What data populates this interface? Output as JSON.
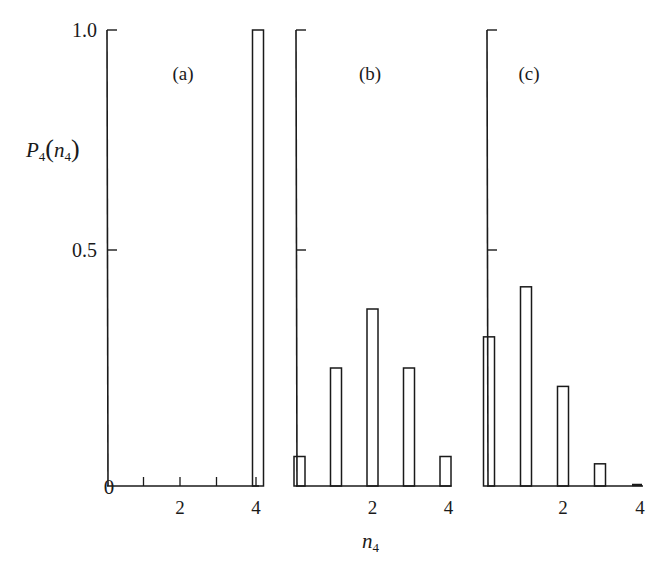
{
  "chart_data": {
    "type": "bar",
    "ylabel": "P4(n4)",
    "ylabel_main": "P",
    "ylabel_sub": "4",
    "ylabel_arg": "n",
    "ylabel_arg_sub": "4",
    "xlabel": "n4",
    "xlabel_main": "n",
    "xlabel_sub": "4",
    "ylim": [
      0,
      1.0
    ],
    "y_ticks": [
      {
        "value": 0.5,
        "label": "0.5"
      },
      {
        "value": 1.0,
        "label": "1.0"
      }
    ],
    "origin_label": "0",
    "x_ticks": [
      0,
      1,
      2,
      3,
      4
    ],
    "x_tick_labels": [
      {
        "value": 2,
        "label": "2"
      },
      {
        "value": 4,
        "label": "4"
      }
    ],
    "categories": [
      0,
      1,
      2,
      3,
      4
    ],
    "series": [
      {
        "name": "(a)",
        "values": [
          0,
          0,
          0,
          0,
          1.0
        ]
      },
      {
        "name": "(b)",
        "values": [
          0.0625,
          0.25,
          0.375,
          0.25,
          0.0625
        ]
      },
      {
        "name": "(c)",
        "values": [
          0.316,
          0.422,
          0.211,
          0.047,
          0.004
        ]
      }
    ],
    "grid": false,
    "legend": "panel labels (a), (b), (c) inside each panel"
  },
  "panels": [
    {
      "label": "(a)"
    },
    {
      "label": "(b)"
    },
    {
      "label": "(c)"
    }
  ]
}
